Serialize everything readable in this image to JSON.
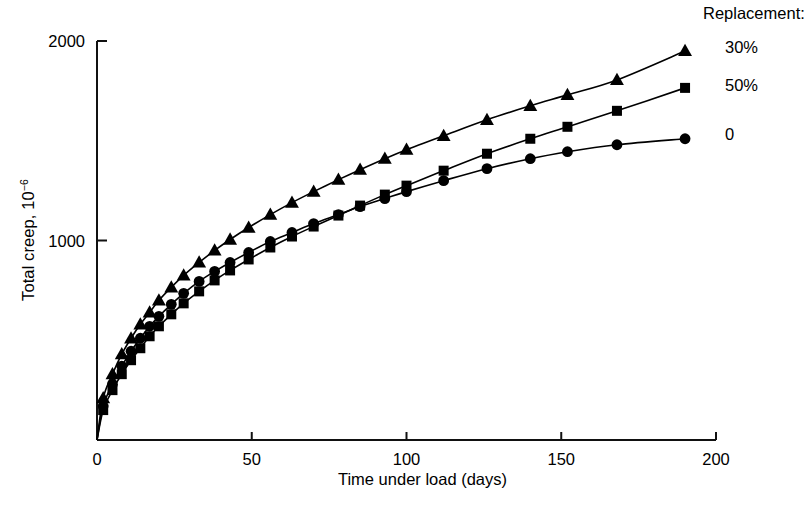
{
  "chart_data": {
    "type": "line",
    "title": "",
    "xlabel": "Time under load (days)",
    "ylabel": "Total creep, 10⁻⁶",
    "ylabel_text": "Total creep, 10",
    "ylabel_exponent": "−6",
    "xlim": [
      0,
      200
    ],
    "ylim": [
      0,
      2000
    ],
    "xticks": [
      0,
      50,
      100,
      150,
      200
    ],
    "xtick_labels": [
      "0",
      "50",
      "100",
      "150",
      "200"
    ],
    "yticks": [
      0,
      1000,
      2000
    ],
    "ytick_labels": [
      "",
      "1000",
      "2000"
    ],
    "grid": false,
    "legend_position": "right-of-curve-ends",
    "legend_title": "Replacement:",
    "series": [
      {
        "name": "30%",
        "marker": "triangle",
        "color": "#000000",
        "x": [
          2,
          5,
          8,
          11,
          14,
          17,
          20,
          24,
          28,
          33,
          38,
          43,
          49,
          56,
          63,
          70,
          78,
          85,
          93,
          100,
          112,
          126,
          140,
          152,
          168,
          190
        ],
        "y": [
          210,
          330,
          430,
          510,
          580,
          640,
          700,
          765,
          825,
          890,
          950,
          1005,
          1065,
          1130,
          1190,
          1245,
          1305,
          1355,
          1410,
          1455,
          1525,
          1605,
          1675,
          1730,
          1805,
          1950
        ]
      },
      {
        "name": "50%",
        "marker": "square",
        "color": "#000000",
        "x": [
          2,
          5,
          8,
          11,
          14,
          17,
          20,
          24,
          28,
          33,
          38,
          43,
          49,
          56,
          63,
          70,
          78,
          85,
          93,
          100,
          112,
          126,
          140,
          152,
          168,
          190
        ],
        "y": [
          150,
          250,
          330,
          400,
          460,
          520,
          570,
          630,
          685,
          745,
          800,
          850,
          905,
          965,
          1020,
          1070,
          1125,
          1175,
          1230,
          1275,
          1350,
          1435,
          1510,
          1570,
          1650,
          1765
        ]
      },
      {
        "name": "0",
        "marker": "circle",
        "color": "#000000",
        "x": [
          2,
          5,
          8,
          11,
          14,
          17,
          20,
          24,
          28,
          33,
          38,
          43,
          49,
          56,
          63,
          70,
          78,
          85,
          93,
          100,
          112,
          126,
          140,
          152,
          168,
          190
        ],
        "y": [
          170,
          280,
          370,
          445,
          510,
          570,
          620,
          680,
          735,
          795,
          845,
          890,
          940,
          995,
          1040,
          1085,
          1130,
          1170,
          1210,
          1245,
          1300,
          1360,
          1410,
          1445,
          1480,
          1510
        ]
      }
    ]
  },
  "axis": {
    "x_title": "Time under load (days)",
    "y_title_main": "Total creep, 10",
    "y_title_sup": "−6"
  },
  "legend": {
    "title": "Replacement:",
    "entries": [
      {
        "label": "30%",
        "marker": "triangle"
      },
      {
        "label": "50%",
        "marker": "square"
      },
      {
        "label": "0",
        "marker": "circle"
      }
    ]
  }
}
